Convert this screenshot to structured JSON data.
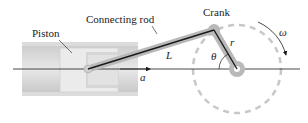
{
  "diagram": {
    "labels": {
      "piston": "Piston",
      "connecting_rod": "Connecting rod",
      "crank": "Crank",
      "rod_length": "L",
      "crank_radius": "r",
      "angle": "θ",
      "angular_velocity": "ω",
      "acceleration": "a"
    },
    "colors": {
      "line": "#1a1a1a",
      "rod_shadow": "#b9b9b9",
      "cylinder": "#d4d4d4",
      "piston": "#e6e6e6",
      "dashed_circle": "#c8c8c8"
    }
  }
}
